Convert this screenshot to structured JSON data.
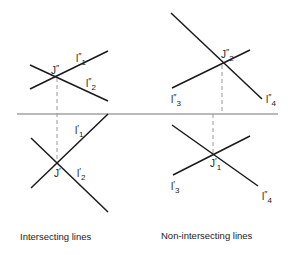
{
  "diagram": {
    "colors": {
      "line": "#1a1a1a",
      "axis": "#777777",
      "projector": "#9a9a9a",
      "text": "#222222"
    },
    "axis": {
      "label": "",
      "x1": 17,
      "y1": 114,
      "x2": 278,
      "y2": 114
    },
    "left": {
      "caption": "Intersecting lines",
      "top_view": {
        "point": {
          "base": "J",
          "prime": "″",
          "sub": ""
        },
        "lines": [
          {
            "base": "l",
            "prime": "″",
            "sub": "1"
          },
          {
            "base": "l",
            "prime": "″",
            "sub": "2"
          }
        ]
      },
      "bottom_view": {
        "point": {
          "base": "J",
          "prime": "′",
          "sub": ""
        },
        "lines": [
          {
            "base": "l",
            "prime": "′",
            "sub": "1"
          },
          {
            "base": "l",
            "prime": "′",
            "sub": "2"
          }
        ]
      }
    },
    "right": {
      "caption": "Non-intersecting lines",
      "top_view": {
        "point": {
          "base": "J",
          "prime": "″",
          "sub": "2"
        },
        "lines": [
          {
            "base": "l",
            "prime": "″",
            "sub": "3"
          },
          {
            "base": "l",
            "prime": "″",
            "sub": "4"
          }
        ]
      },
      "bottom_view": {
        "point": {
          "base": "J",
          "prime": "′",
          "sub": "1"
        },
        "lines": [
          {
            "base": "l",
            "prime": "′",
            "sub": "3"
          },
          {
            "base": "l",
            "prime": "″",
            "sub": "4"
          }
        ]
      }
    }
  }
}
